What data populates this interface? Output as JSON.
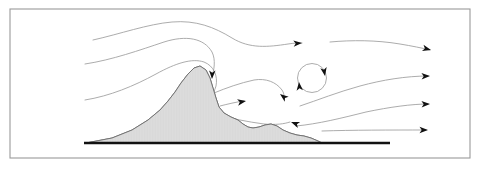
{
  "figure": {
    "kind": "streamline-flow-diagram",
    "width": 480,
    "height": 169,
    "background_color": "#ffffff"
  },
  "frame": {
    "name": "figure-border",
    "x": 10,
    "y": 9,
    "width": 460,
    "height": 149,
    "stroke_color": "#9a9a9a",
    "stroke_width": 1.1
  },
  "colors": {
    "streamline": "#9d9d9d",
    "arrowhead": "#111111",
    "terrain_fill": "#dcdcdc",
    "terrain_stroke": "#6d6d6d",
    "ground": "#111111",
    "frame": "#9a9a9a",
    "hatch": "#cfcfcf"
  },
  "ground": {
    "name": "ground-surface-line",
    "x1": 84,
    "y1": 143,
    "x2": 390,
    "y2": 143,
    "stroke_width": 2.4,
    "color": "#111111"
  },
  "terrain": {
    "name": "mountain-profile",
    "description": "Asymmetric mountain with steep lee slope and right-side foothills",
    "peak": {
      "x": 196,
      "y": 67
    },
    "base_left": {
      "x": 86,
      "y": 143
    },
    "base_right": {
      "x": 318,
      "y": 143
    },
    "path": "M 86 143 L 112 138 L 132 130 L 148 120 L 160 110 L 168 101 L 175 92 L 181 83 L 188 74 L 194 68 L 200 66 L 206 70 L 210 78 L 213 88 L 216 98 L 219 107 L 224 113 L 231 117 L 238 120 L 243 124 L 248 127 L 253 128 L 259 127 L 265 125 L 271 124 L 277 126 L 283 130 L 290 133 L 297 135 L 304 136 L 311 138 L 318 141 L 322 143 Z",
    "hatch_spacing": 1.6
  },
  "streamlines": [
    {
      "id": "streamline-1",
      "name": "streamline-upper-crest",
      "label": "Upper streamline crossing the mountain crest",
      "path": "M 93 40 C 120 34 148 24 172 22 C 196 20 214 27 232 38 C 250 49 268 47 288 44 C 294 43 298 43 302 43",
      "arrowheads": [
        {
          "x": 302,
          "y": 43,
          "angle": -4
        }
      ]
    },
    {
      "id": "streamline-1b",
      "name": "streamline-upper-outflow",
      "label": "Upper outflow streamline to right boundary",
      "path": "M 330 42 C 352 40 376 40 400 44 C 412 46 422 48 430 50",
      "arrowheads": [
        {
          "x": 431,
          "y": 50,
          "angle": 14
        }
      ]
    },
    {
      "id": "streamline-2",
      "name": "streamline-middle-descending",
      "label": "Middle streamline plunging down the lee slope",
      "path": "M 85 64 C 112 60 140 50 164 42 C 186 35 204 38 212 52 C 216 60 214 70 212 77",
      "arrowheads": [
        {
          "x": 212,
          "y": 79,
          "angle": 92
        }
      ]
    },
    {
      "id": "streamline-3",
      "name": "streamline-lower-windward",
      "label": "Lower windward streamline wrapping the mountain flank",
      "path": "M 85 100 C 110 96 134 86 156 74 C 176 63 192 58 204 62 C 214 66 218 76 216 86 C 214 94 208 99 202 102",
      "arrowheads": [
        {
          "x": 200,
          "y": 103,
          "angle": 160
        }
      ]
    },
    {
      "id": "streamline-4",
      "name": "streamline-lee-updraft",
      "label": "Lee-side recirculating updraft streamline",
      "path": "M 214 93 C 226 88 240 83 254 80 C 266 78 276 82 282 90 C 284 93 284 95 284 97",
      "arrowheads": [
        {
          "x": 280,
          "y": 94,
          "angle": 218
        }
      ]
    },
    {
      "id": "streamline-5",
      "name": "streamline-lee-horizontal",
      "label": "Lee-side horizontal turbulent streamline",
      "path": "M 220 106 C 228 104 236 102 244 101",
      "arrowheads": [
        {
          "x": 246,
          "y": 101,
          "angle": -10
        }
      ]
    },
    {
      "id": "streamline-6",
      "name": "streamline-lee-lower",
      "label": "Lower lee-side streamline beneath the rotor",
      "path": "M 216 115 C 230 118 248 122 264 124 C 276 125 284 124 290 122",
      "arrowheads": [
        {
          "x": 291,
          "y": 122,
          "angle": 200
        }
      ]
    },
    {
      "id": "streamline-7",
      "name": "streamline-rotor-outflow-upper",
      "label": "Streamline exiting right of the rotor, upper branch",
      "path": "M 300 106 C 318 100 338 92 360 86 C 382 80 406 76 428 76",
      "arrowheads": [
        {
          "x": 430,
          "y": 76,
          "angle": -2
        }
      ]
    },
    {
      "id": "streamline-8",
      "name": "streamline-outflow-mid",
      "label": "Mid-level outflow streamline",
      "path": "M 296 126 C 318 124 342 118 366 112 C 390 107 412 104 428 104",
      "arrowheads": [
        {
          "x": 430,
          "y": 104,
          "angle": -2
        }
      ]
    },
    {
      "id": "streamline-9",
      "name": "streamline-outflow-lowest",
      "label": "Lowest outflow streamline near the surface",
      "path": "M 322 131 C 352 130 390 130 426 130",
      "arrowheads": [
        {
          "x": 428,
          "y": 130,
          "angle": 0
        }
      ]
    }
  ],
  "vortex": {
    "name": "lee-rotor-vortex",
    "label": "Closed rotor circulation in the mountain lee",
    "center": {
      "x": 312,
      "y": 78
    },
    "radius": 14.5,
    "rotation": "clockwise",
    "arrowheads": [
      {
        "x": 299,
        "y": 82,
        "angle": 265,
        "name": "vortex-arrow-left-up"
      },
      {
        "x": 325,
        "y": 76,
        "angle": 80,
        "name": "vortex-arrow-right-down"
      }
    ]
  },
  "arrowhead_style": {
    "length": 8.5,
    "half_width": 3.2,
    "notch": 2.2,
    "color": "#111111"
  }
}
